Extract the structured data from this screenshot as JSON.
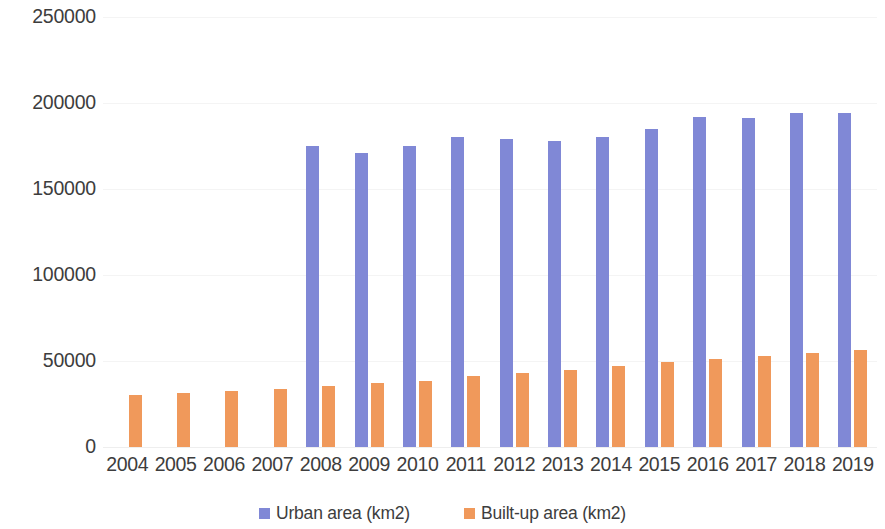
{
  "chart_data": {
    "type": "bar",
    "title": "",
    "subtitle": "",
    "xlabel": "",
    "ylabel": "",
    "grid": true,
    "legend_position": "bottom",
    "ylim": [
      0,
      250000
    ],
    "ytick_labels": [
      "250000",
      "200000",
      "150000",
      "100000",
      "50000",
      "0"
    ],
    "ytick_values": [
      250000,
      200000,
      150000,
      100000,
      50000,
      0
    ],
    "categories": [
      "2004",
      "2005",
      "2006",
      "2007",
      "2008",
      "2009",
      "2010",
      "2011",
      "2012",
      "2013",
      "2014",
      "2015",
      "2016",
      "2017",
      "2018",
      "2019"
    ],
    "series": [
      {
        "name": "Urban area (km2)",
        "color": "#8088d6",
        "values": [
          null,
          null,
          null,
          null,
          175000,
          171000,
          175000,
          180000,
          179000,
          178000,
          180000,
          185000,
          192000,
          191000,
          194000,
          194000
        ]
      },
      {
        "name": "Built-up area (km2)",
        "color": "#f0995b",
        "values": [
          30500,
          31500,
          32500,
          34000,
          35500,
          37000,
          38500,
          41000,
          43000,
          45000,
          47000,
          49500,
          51000,
          53000,
          54500,
          56500
        ]
      }
    ]
  },
  "legend": {
    "items": [
      {
        "label": "Urban area (km2)",
        "color": "#8088d6",
        "swatch_name": "legend-swatch-urban"
      },
      {
        "label": "Built-up area (km2)",
        "color": "#f0995b",
        "swatch_name": "legend-swatch-built-up"
      }
    ]
  },
  "colors": {
    "urban": "#8088d6",
    "built_up": "#f0995b",
    "text": "#3d3d3d",
    "gridline": "#f4f4f4",
    "background": "#ffffff"
  }
}
